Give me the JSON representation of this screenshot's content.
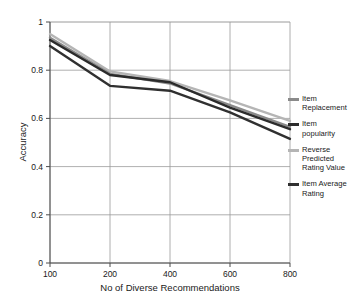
{
  "chart_data": {
    "type": "line",
    "title": "",
    "xlabel": "No of Diverse Recommendations",
    "ylabel": "Accuracy",
    "categories": [
      "100",
      "200",
      "400",
      "600",
      "800"
    ],
    "xticklabels": [
      "100",
      "200",
      "400",
      "600",
      "800"
    ],
    "yticklabels": [
      "0",
      "0.2",
      "0.4",
      "0.6",
      "0.8",
      "1"
    ],
    "yticks": [
      0,
      0.2,
      0.4,
      0.6,
      0.8,
      1
    ],
    "ylim": [
      0,
      1
    ],
    "grid": true,
    "legend_position": "right",
    "series": [
      {
        "name": "Item Replacement",
        "label": "Item\nReplacement",
        "color": "#8a8a8a",
        "values": [
          0.935,
          0.785,
          0.745,
          0.655,
          0.565
        ]
      },
      {
        "name": "Item popularity",
        "label": "Item\npopularity",
        "color": "#2b2b2b",
        "values": [
          0.925,
          0.78,
          0.75,
          0.645,
          0.555
        ]
      },
      {
        "name": "Reverse Predicted Rating Value",
        "label": "Reverse\nPredicted\nRating Value",
        "color": "#b5b5b5",
        "values": [
          0.95,
          0.795,
          0.755,
          0.675,
          0.59
        ]
      },
      {
        "name": "Item Average Rating",
        "label": "Item Average\nRating",
        "color": "#303030",
        "values": [
          0.9,
          0.735,
          0.715,
          0.625,
          0.515
        ]
      }
    ]
  },
  "axes": {
    "ylabel": "Accuracy",
    "xlabel": "No of Diverse Recommendations"
  },
  "colors": {
    "axis": "#4d4d4d",
    "grid": "#9a9a9a",
    "background": "#ffffff"
  }
}
